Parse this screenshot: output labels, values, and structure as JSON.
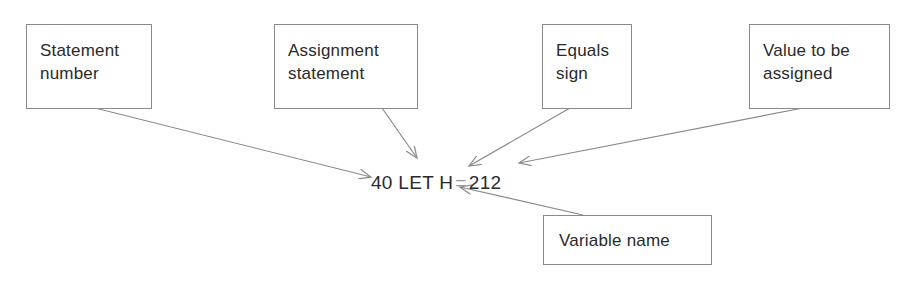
{
  "diagram": {
    "code_line": {
      "number": "40",
      "keyword": "LET",
      "variable": "H",
      "equals": "=",
      "value": "212"
    },
    "labels": [
      {
        "id": "statement-number",
        "line1": "Statement",
        "line2": "number"
      },
      {
        "id": "assignment-statement",
        "line1": "Assignment",
        "line2": "statement"
      },
      {
        "id": "equals-sign",
        "line1": "Equals",
        "line2": "sign"
      },
      {
        "id": "value-to-be-assigned",
        "line1": "Value to be",
        "line2": "assigned"
      },
      {
        "id": "variable-name",
        "line1": "Variable name",
        "line2": ""
      }
    ],
    "colors": {
      "box_border": "#8a8a8a",
      "arrow": "#8a8a8a",
      "text": "#2a2a2a"
    }
  }
}
